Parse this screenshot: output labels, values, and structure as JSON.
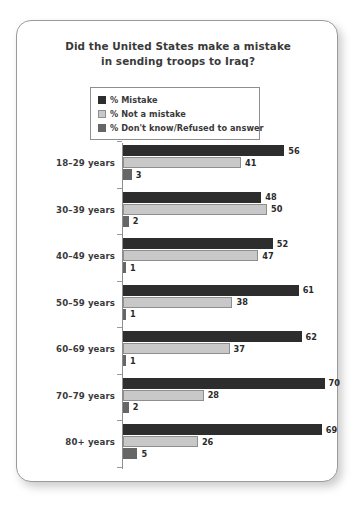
{
  "card": {
    "title_line_1": "Did the United States make a mistake",
    "title_line_2": "in sending troops to Iraq?"
  },
  "legend": {
    "items": [
      {
        "label": "% Mistake",
        "swatch": "dark-swatch",
        "color": "#2d2d2d"
      },
      {
        "label": "% Not a mistake",
        "swatch": "light-swatch",
        "color": "#c8c8c8"
      },
      {
        "label": "% Don't know/Refused to answer",
        "swatch": "medium-swatch",
        "color": "#666666"
      }
    ]
  },
  "chart_data": {
    "type": "bar",
    "orientation": "horizontal",
    "title": "Did the United States make a mistake in sending troops to Iraq?",
    "xlabel": "",
    "ylabel": "",
    "xlim": [
      0,
      70
    ],
    "grid": false,
    "legend_position": "top-center",
    "categories": [
      "18–29 years",
      "30–39 years",
      "40–49 years",
      "50–59 years",
      "60–69 years",
      "70–79 years",
      "80+ years"
    ],
    "series": [
      {
        "name": "% Mistake",
        "color": "#2d2d2d",
        "values": [
          56,
          48,
          52,
          61,
          62,
          70,
          69
        ]
      },
      {
        "name": "% Not a mistake",
        "color": "#c8c8c8",
        "values": [
          41,
          50,
          47,
          38,
          37,
          28,
          26
        ]
      },
      {
        "name": "% Don't know/Refused to answer",
        "color": "#666666",
        "values": [
          3,
          2,
          1,
          1,
          1,
          2,
          5
        ]
      }
    ]
  }
}
